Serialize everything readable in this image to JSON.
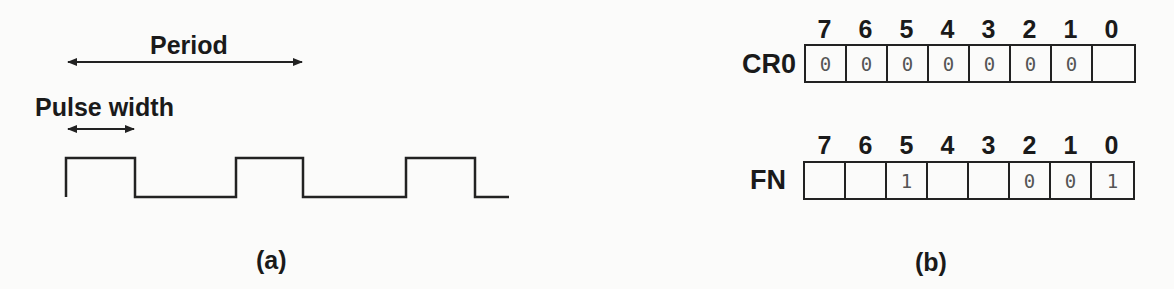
{
  "panel_a": {
    "period_label": "Period",
    "pulse_width_label": "Pulse width",
    "caption": "(a)",
    "waveform": {
      "high_y": 158,
      "low_y": 197,
      "start_x": 66,
      "end_x": 509,
      "pulses": [
        [
          66,
          135
        ],
        [
          236,
          303
        ],
        [
          406,
          475
        ]
      ]
    }
  },
  "panel_b": {
    "caption": "(b)",
    "registers": [
      {
        "name": "CR0",
        "bit_indices": [
          "7",
          "6",
          "5",
          "4",
          "3",
          "2",
          "1",
          "0"
        ],
        "bits": [
          "0",
          "0",
          "0",
          "0",
          "0",
          "0",
          "0",
          ""
        ]
      },
      {
        "name": "FN",
        "bit_indices": [
          "7",
          "6",
          "5",
          "4",
          "3",
          "2",
          "1",
          "0"
        ],
        "bits": [
          "",
          "",
          "1",
          "",
          "",
          "0",
          "0",
          "1"
        ]
      }
    ]
  }
}
